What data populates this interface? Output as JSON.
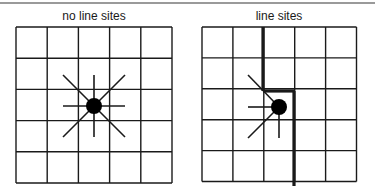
{
  "panels": [
    {
      "title": "no line sites",
      "grid": {
        "x0": 16,
        "y0": 27,
        "cols": 5,
        "rows": 5,
        "cell": 31.2
      },
      "center": {
        "x": 94,
        "y": 106,
        "r": 8
      },
      "spokes": [
        {
          "x1": 63,
          "y1": 75,
          "x2": 125,
          "y2": 137
        },
        {
          "x1": 125,
          "y1": 75,
          "x2": 63,
          "y2": 137
        },
        {
          "x1": 63,
          "y1": 106,
          "x2": 125,
          "y2": 106
        },
        {
          "x1": 94,
          "y1": 75,
          "x2": 94,
          "y2": 137
        }
      ],
      "line_sites": []
    },
    {
      "title": "line sites",
      "grid": {
        "x0": 202,
        "y0": 27,
        "cols": 5,
        "rows": 5,
        "cell": 30.9
      },
      "center": {
        "x": 279,
        "y": 107,
        "r": 8
      },
      "spokes": [
        {
          "x1": 279,
          "y1": 107,
          "x2": 248,
          "y2": 75
        },
        {
          "x1": 279,
          "y1": 107,
          "x2": 248,
          "y2": 107
        },
        {
          "x1": 279,
          "y1": 107,
          "x2": 248,
          "y2": 138
        },
        {
          "x1": 279,
          "y1": 107,
          "x2": 279,
          "y2": 138
        }
      ],
      "line_sites": [
        {
          "x1": 263,
          "y1": 27,
          "x2": 263,
          "y2": 91
        },
        {
          "x1": 263,
          "y1": 91,
          "x2": 294,
          "y2": 91
        },
        {
          "x1": 294,
          "y1": 91,
          "x2": 294,
          "y2": 186
        }
      ]
    }
  ],
  "colors": {
    "stroke": "#1a1a1a",
    "divider": "#9a9a9a"
  }
}
